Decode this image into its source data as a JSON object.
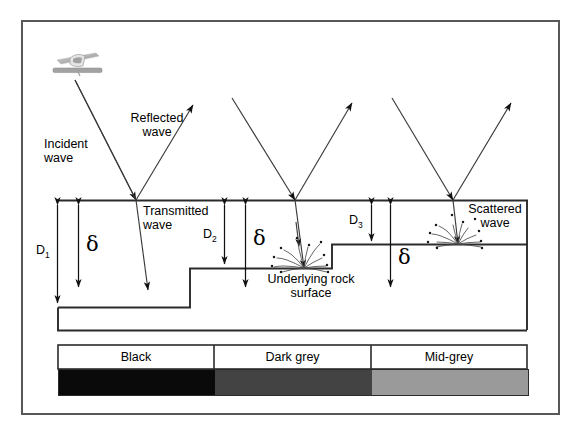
{
  "figure": {
    "type": "scientific-diagram",
    "frame": {
      "border_color": "#58585a"
    }
  },
  "annotations": {
    "incident_wave": "Incident\nwave",
    "reflected_wave": "Reflected\nwave",
    "transmitted_wave": "Transmitted\nwave",
    "scattered_wave": "Scattered\nwave",
    "underlying_rock_surface": "Underlying rock\nsurface",
    "sensor_icon_name": "airborne-sensor-icon"
  },
  "depth_labels": [
    {
      "id": "d1",
      "text": "D",
      "sub": "1"
    },
    {
      "id": "d2",
      "text": "D",
      "sub": "2"
    },
    {
      "id": "d3",
      "text": "D",
      "sub": "3"
    }
  ],
  "penetration_symbols": [
    {
      "id": "delta-1",
      "glyph": "δ"
    },
    {
      "id": "delta-2",
      "glyph": "δ"
    },
    {
      "id": "delta-3",
      "glyph": "δ"
    }
  ],
  "tone_bar": {
    "cells": [
      {
        "label": "Black",
        "color": "#0a0a0a"
      },
      {
        "label": "Dark grey",
        "color": "#434343"
      },
      {
        "label": "Mid-grey",
        "color": "#9a9a9a"
      }
    ]
  },
  "chart_data": {
    "type": "diagram",
    "segments": [
      {
        "name": "segment-1",
        "sand_thickness_label": "D1",
        "penetration_label": "delta",
        "penetration_vs_thickness": "delta < D1",
        "image_tone": "Black"
      },
      {
        "name": "segment-2",
        "sand_thickness_label": "D2",
        "penetration_label": "delta",
        "penetration_vs_thickness": "delta > D2",
        "image_tone": "Dark grey"
      },
      {
        "name": "segment-3",
        "sand_thickness_label": "D3",
        "penetration_label": "delta",
        "penetration_vs_thickness": "delta > D3",
        "image_tone": "Mid-grey"
      }
    ],
    "wave_paths": [
      "incident",
      "reflected",
      "transmitted",
      "scattered"
    ]
  }
}
